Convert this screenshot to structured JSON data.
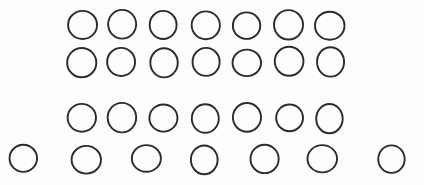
{
  "document": {
    "title": "Counting Circles Worksheet",
    "kind": "hand-drawn-circle-grid",
    "background_color": "#fdfdfc",
    "stroke_color": "#2b2b2b",
    "stroke_width": 1.9,
    "canvas": {
      "width": 424,
      "height": 185
    },
    "total_circles": 28,
    "row_count": 4,
    "columns_per_row": 7
  },
  "rows": [
    {
      "index": 1,
      "name": "circle-row-1",
      "count": 7,
      "center_y": 25,
      "radius": 14,
      "centers_x": [
        82,
        122,
        164,
        206,
        247,
        289,
        330
      ]
    },
    {
      "index": 2,
      "name": "circle-row-2",
      "count": 7,
      "center_y": 62,
      "radius": 14,
      "centers_x": [
        82,
        122,
        164,
        206,
        247,
        289,
        330
      ]
    },
    {
      "index": 3,
      "name": "circle-row-3",
      "count": 7,
      "center_y": 118,
      "radius": 14,
      "centers_x": [
        82,
        122,
        164,
        206,
        247,
        289,
        330
      ]
    },
    {
      "index": 4,
      "name": "circle-row-4",
      "count": 7,
      "center_y": 159,
      "radius": 14,
      "centers_x": [
        23,
        87,
        146,
        205,
        264,
        323,
        392
      ]
    }
  ]
}
